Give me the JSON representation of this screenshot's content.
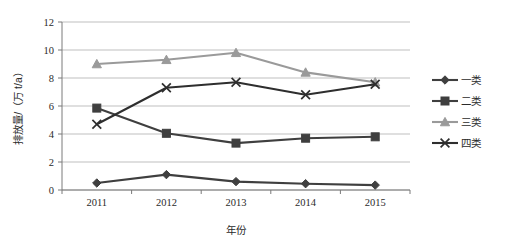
{
  "chart_data": {
    "type": "line",
    "title": "",
    "xlabel": "年份",
    "ylabel": "排放量/（万 t/a）",
    "categories": [
      "2011",
      "2012",
      "2013",
      "2014",
      "2015"
    ],
    "x": [
      2011,
      2012,
      2013,
      2014,
      2015
    ],
    "ylim": [
      0,
      12
    ],
    "yticks": [
      "0",
      "2",
      "4",
      "6",
      "8",
      "10",
      "12"
    ],
    "ytick_values": [
      0,
      2,
      4,
      6,
      8,
      10,
      12
    ],
    "grid": "horizontal",
    "legend_position": "right",
    "series": [
      {
        "name": "一类",
        "marker": "diamond",
        "color": "#3f3f3f",
        "values": [
          0.5,
          1.1,
          0.6,
          0.45,
          0.35
        ]
      },
      {
        "name": "二类",
        "marker": "square",
        "color": "#3f3f3f",
        "values": [
          5.85,
          4.05,
          3.35,
          3.7,
          3.8
        ]
      },
      {
        "name": "三类",
        "marker": "triangle",
        "color": "#9a9a9a",
        "values": [
          9.0,
          9.3,
          9.8,
          8.4,
          7.7
        ]
      },
      {
        "name": "四类",
        "marker": "cross",
        "color": "#2e2e2e",
        "values": [
          4.7,
          7.3,
          7.7,
          6.8,
          7.55
        ]
      }
    ]
  },
  "legend": {
    "items": [
      {
        "label": "一类"
      },
      {
        "label": "二类"
      },
      {
        "label": "三类"
      },
      {
        "label": "四类"
      }
    ]
  },
  "axes": {
    "y_title": "排放量/（万 t/a）",
    "x_title": "年份",
    "y_tick_labels": [
      "12",
      "10",
      "8",
      "6",
      "4",
      "2",
      "0"
    ],
    "x_tick_labels": [
      "2011",
      "2012",
      "2013",
      "2014",
      "2015"
    ]
  },
  "colors": {
    "series_one": "#3f3f3f",
    "series_two": "#3f3f3f",
    "series_three": "#9a9a9a",
    "series_four": "#2e2e2e",
    "grid": "#b8b8b8",
    "axis": "#7a7a7a",
    "text": "#2b2b2b",
    "background": "#ffffff"
  }
}
